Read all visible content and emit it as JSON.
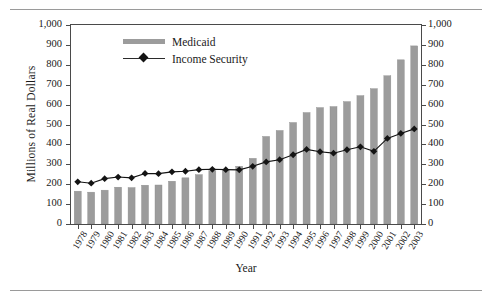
{
  "figure": {
    "axis_titles": {
      "y": "Millions of Real Dollars",
      "x": "Year"
    }
  },
  "legend": {
    "items": [
      {
        "label": "Medicaid",
        "marker": "bar-swatch",
        "color": "#9c9c9c"
      },
      {
        "label": "Income Security",
        "marker": "line-diamond-marker",
        "color": "#141414"
      }
    ]
  },
  "chart_data": {
    "type": "bar",
    "title": "",
    "xlabel": "Year",
    "ylabel": "Millions of Real Dollars",
    "ylim": [
      0,
      1000
    ],
    "y2lim": [
      0,
      1000
    ],
    "ytick_labels": [
      "0",
      "100",
      "200",
      "300",
      "400",
      "500",
      "600",
      "700",
      "800",
      "900",
      "1,000"
    ],
    "y2tick_labels": [
      "0",
      "100",
      "200",
      "300",
      "400",
      "500",
      "600",
      "700",
      "800",
      "900",
      "1,000"
    ],
    "grid": false,
    "legend_position": "upper-center-left",
    "categories": [
      "1978",
      "1979",
      "1980",
      "1981",
      "1982",
      "1983",
      "1984",
      "1985",
      "1986",
      "1987",
      "1988",
      "1989",
      "1990",
      "1991",
      "1992",
      "1993",
      "1994",
      "1995",
      "1996",
      "1997",
      "1998",
      "1999",
      "2000",
      "2001",
      "2002",
      "2003"
    ],
    "series": [
      {
        "name": "Medicaid",
        "type": "bar",
        "color": "#9c9c9c",
        "values": [
          165,
          160,
          170,
          185,
          183,
          195,
          196,
          215,
          232,
          248,
          268,
          270,
          290,
          330,
          440,
          470,
          510,
          560,
          585,
          590,
          615,
          645,
          680,
          745,
          825,
          895
        ]
      },
      {
        "name": "Income Security",
        "type": "line",
        "color": "#141414",
        "marker": "diamond",
        "values": [
          212,
          205,
          228,
          236,
          232,
          254,
          253,
          262,
          265,
          273,
          275,
          273,
          272,
          290,
          312,
          323,
          348,
          375,
          363,
          356,
          373,
          388,
          365,
          430,
          455,
          478
        ]
      }
    ]
  }
}
